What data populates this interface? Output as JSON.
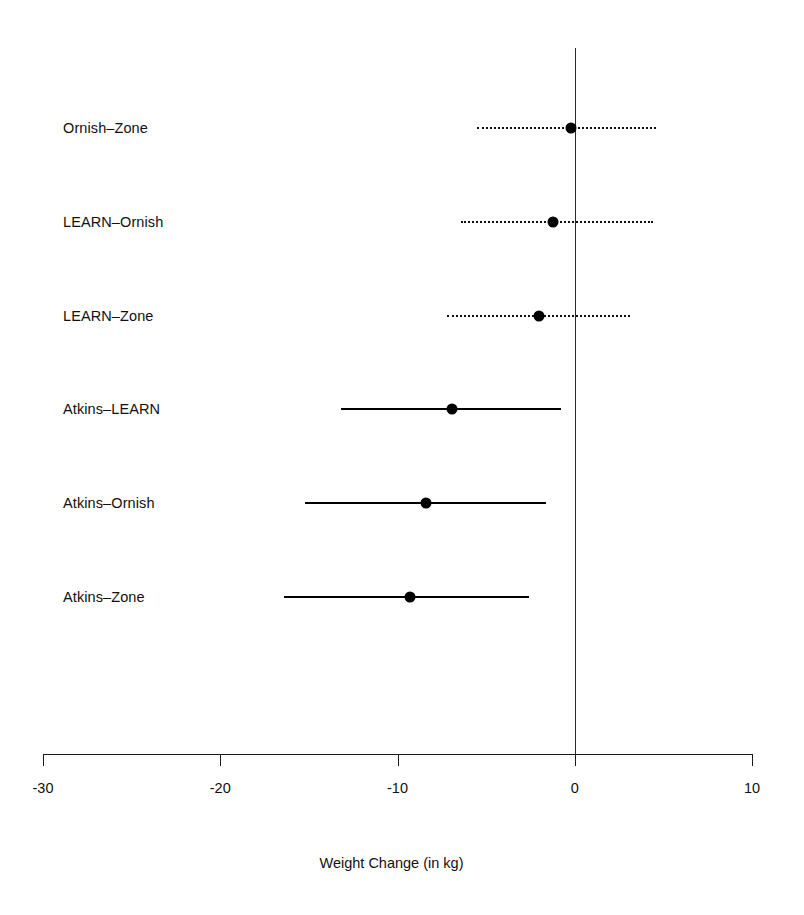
{
  "chart_data": {
    "type": "scatter",
    "subtype": "forest-plot",
    "title": "",
    "xlabel": "Weight Change (in kg)",
    "ylabel": "",
    "xlim": [
      -30,
      10
    ],
    "xticks": [
      -30,
      -20,
      -10,
      0,
      10
    ],
    "xticklabels": [
      "-30",
      "-20",
      "-10",
      "0",
      "10"
    ],
    "grid": false,
    "legend": null,
    "reference_line": {
      "x": 0,
      "style": "solid",
      "color": "#2a2a2a"
    },
    "categories": [
      "Ornish–Zone",
      "LEARN–Ornish",
      "LEARN–Zone",
      "Atkins–LEARN",
      "Atkins–Ornish",
      "Atkins–Zone"
    ],
    "points": [
      {
        "label": "Ornish–Zone",
        "estimate": -0.2,
        "ci_low": -5.5,
        "ci_high": 4.6,
        "interval_style": "dotted",
        "significant": false
      },
      {
        "label": "LEARN–Ornish",
        "estimate": -1.2,
        "ci_low": -6.4,
        "ci_high": 4.4,
        "interval_style": "dotted",
        "significant": false
      },
      {
        "label": "LEARN–Zone",
        "estimate": -2.0,
        "ci_low": -7.2,
        "ci_high": 3.1,
        "interval_style": "dotted",
        "significant": false
      },
      {
        "label": "Atkins–LEARN",
        "estimate": -6.9,
        "ci_low": -13.2,
        "ci_high": -0.8,
        "interval_style": "solid",
        "significant": true
      },
      {
        "label": "Atkins–Ornish",
        "estimate": -8.4,
        "ci_low": -15.2,
        "ci_high": -1.6,
        "interval_style": "solid",
        "significant": true
      },
      {
        "label": "Atkins–Zone",
        "estimate": -9.3,
        "ci_low": -16.4,
        "ci_high": -2.6,
        "interval_style": "solid",
        "significant": true
      }
    ],
    "colors": {
      "marker": "#000000",
      "solid_interval": "#000000",
      "dotted_interval": "#0e0e0e",
      "axis": "#1a1a1a",
      "background": "#ffffff"
    }
  },
  "axis": {
    "x_title": "Weight Change (in kg)",
    "tick_labels": [
      "-30",
      "-20",
      "-10",
      "0",
      "10"
    ]
  },
  "rows": {
    "labels": [
      "Ornish–Zone",
      "LEARN–Ornish",
      "LEARN–Zone",
      "Atkins–LEARN",
      "Atkins–Ornish",
      "Atkins–Zone"
    ]
  },
  "geometry": {
    "x_min_px": 43,
    "x_max_px": 752,
    "x_min_val": -30,
    "x_max_val": 10,
    "axis_y_px": 754,
    "tick_len_px": 12,
    "tick_label_y_px": 780,
    "x_title_y_px": 855,
    "label_x_px": 63,
    "row_y_px": [
      128,
      222,
      316,
      409,
      503,
      597
    ],
    "zero_line_top_px": 48,
    "zero_line_bottom_px": 756
  }
}
